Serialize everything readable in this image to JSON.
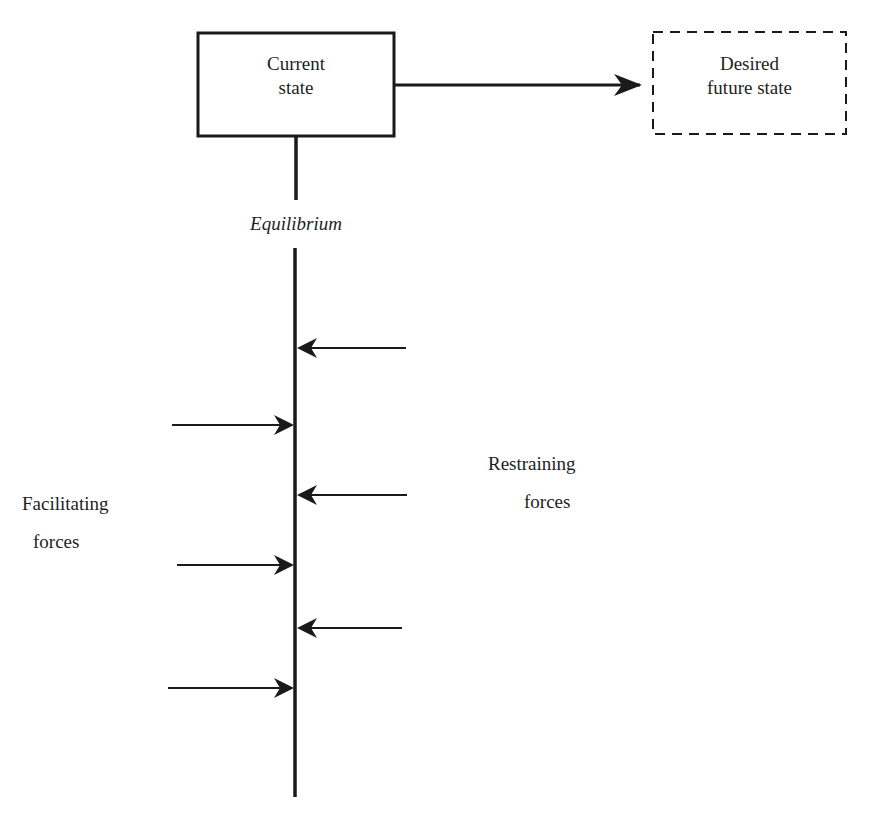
{
  "diagram": {
    "type": "force-field-analysis",
    "current_state": {
      "line1": "Current",
      "line2": "state"
    },
    "desired_state": {
      "line1": "Desired",
      "line2": "future state"
    },
    "equilibrium_label": "Equilibrium",
    "facilitating_label": {
      "line1": "Facilitating",
      "line2": "forces"
    },
    "restraining_label": {
      "line1": "Restraining",
      "line2": "forces"
    },
    "facilitating_arrow_count": 3,
    "restraining_arrow_count": 3,
    "colors": {
      "stroke": "#1a1a1a",
      "background": "#ffffff"
    }
  }
}
